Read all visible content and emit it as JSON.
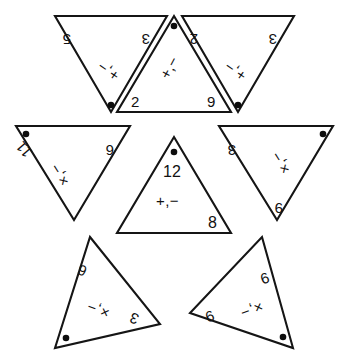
{
  "diagram": {
    "background_color": "#ffffff",
    "line_color": "#151515",
    "text_color": "#111111",
    "dot_color": "#0d0d0d",
    "tile_count": 7
  },
  "tiles": [
    {
      "id": "tile-top-left",
      "orientation": "pointing-down",
      "rotation_deg": 180,
      "corners": [
        "5",
        "3",
        ""
      ],
      "corner_left": "5",
      "corner_right": "3",
      "operator": "+,−",
      "has_dot": true,
      "dot_position": "bottom-vertex"
    },
    {
      "id": "tile-top-center",
      "orientation": "pointing-up",
      "rotation_deg": 0,
      "corners": [
        "2",
        "9",
        ""
      ],
      "corner_left": "2",
      "corner_right": "9",
      "operator": "+,−",
      "has_dot": true,
      "dot_position": "top-vertex"
    },
    {
      "id": "tile-top-right",
      "orientation": "pointing-down",
      "rotation_deg": 180,
      "corners": [
        "2",
        "3",
        ""
      ],
      "corner_left": "2",
      "corner_right": "3",
      "operator": "+,−",
      "has_dot": true,
      "dot_position": "bottom-vertex"
    },
    {
      "id": "tile-left",
      "orientation": "pointing-down",
      "rotation_deg": 180,
      "corners": [
        "11",
        "6",
        ""
      ],
      "corner_left": "11",
      "corner_right": "6",
      "operator": "×,−",
      "has_dot": true,
      "dot_position": "top-left-corner"
    },
    {
      "id": "tile-center",
      "orientation": "pointing-up",
      "rotation_deg": 0,
      "corners": [
        "12",
        "8",
        ""
      ],
      "corner_top": "12",
      "corner_right": "8",
      "operator": "+,−",
      "has_dot": true,
      "dot_position": "top-vertex"
    },
    {
      "id": "tile-right",
      "orientation": "pointing-down",
      "rotation_deg": 180,
      "corners": [
        "3",
        "9",
        ""
      ],
      "corner_left": "3",
      "corner_right": "9",
      "operator": "×,−",
      "has_dot": true,
      "dot_position": "top-right-corner"
    },
    {
      "id": "tile-bottom-left",
      "orientation": "rotated",
      "rotation_deg": 205,
      "corners": [
        "6",
        "3",
        ""
      ],
      "corner_left": "6",
      "corner_right": "3",
      "operator": "×,−",
      "has_dot": true,
      "dot_position": "bottom-left-corner"
    },
    {
      "id": "tile-bottom-right",
      "orientation": "rotated",
      "rotation_deg": 155,
      "corners": [
        "9",
        "9",
        ""
      ],
      "corner_left": "9",
      "corner_right": "9",
      "operator": "×,−",
      "has_dot": true,
      "dot_position": "bottom-right-corner"
    }
  ],
  "labels": {
    "tl_a": "5",
    "tl_b": "3",
    "tl_op": "+,−",
    "tc_a": "2",
    "tc_b": "9",
    "tc_op": "+,−",
    "tr_a": "2",
    "tr_b": "3",
    "tr_op": "+,−",
    "lf_a": "11",
    "lf_b": "6",
    "lf_op": "×,−",
    "ct_a": "12",
    "ct_b": "8",
    "ct_op": "+,−",
    "rt_a": "3",
    "rt_b": "9",
    "rt_op": "×,−",
    "bl_a": "6",
    "bl_b": "3",
    "bl_op": "×,−",
    "br_a": "9",
    "br_b": "9",
    "br_op": "×,−"
  }
}
